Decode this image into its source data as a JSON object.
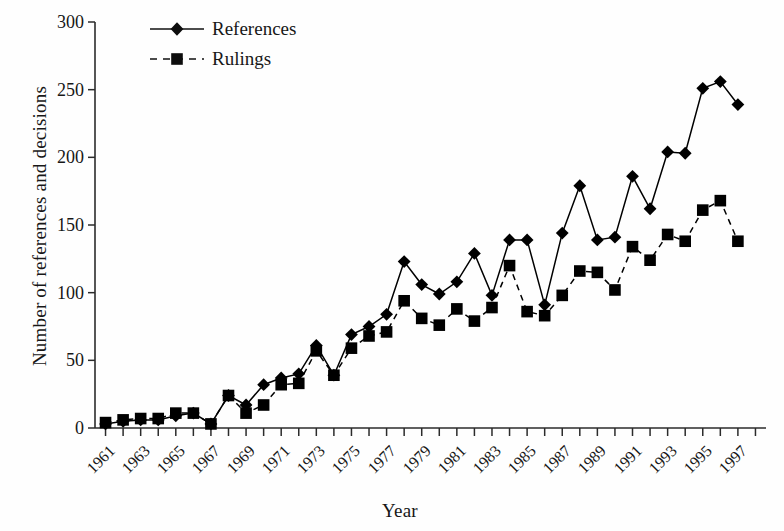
{
  "chart_data": {
    "type": "line",
    "title": "",
    "xlabel": "Year",
    "ylabel": "Number of references and decisions",
    "xlim": [
      1960.4,
      1998.6
    ],
    "ylim": [
      0,
      300
    ],
    "yticks": [
      0,
      50,
      100,
      150,
      200,
      250,
      300
    ],
    "ytick_labels": [
      "0",
      "50",
      "100",
      "150",
      "200",
      "250",
      "300"
    ],
    "xticks": [
      1961,
      1963,
      1965,
      1967,
      1969,
      1971,
      1973,
      1975,
      1977,
      1979,
      1981,
      1983,
      1985,
      1987,
      1989,
      1991,
      1993,
      1995,
      1997
    ],
    "xtick_labels": [
      "1961",
      "1963",
      "1965",
      "1967",
      "1969",
      "1971",
      "1973",
      "1975",
      "1977",
      "1979",
      "1981",
      "1983",
      "1985",
      "1987",
      "1989",
      "1991",
      "1993",
      "1995",
      "1997"
    ],
    "x": [
      1961,
      1962,
      1963,
      1964,
      1965,
      1966,
      1967,
      1968,
      1969,
      1970,
      1971,
      1972,
      1973,
      1974,
      1975,
      1976,
      1977,
      1978,
      1979,
      1980,
      1981,
      1982,
      1983,
      1984,
      1985,
      1986,
      1987,
      1988,
      1989,
      1990,
      1991,
      1992,
      1993,
      1994,
      1995,
      1996,
      1997
    ],
    "grid": false,
    "legend_position": "top-left",
    "series": [
      {
        "name": "References",
        "marker": "diamond",
        "linestyle": "solid",
        "color": "#000000",
        "values": [
          3,
          5,
          6,
          6,
          9,
          11,
          3,
          24,
          17,
          32,
          37,
          40,
          61,
          39,
          69,
          75,
          84,
          123,
          106,
          99,
          108,
          129,
          98,
          139,
          139,
          91,
          144,
          179,
          139,
          141,
          186,
          162,
          204,
          203,
          251,
          256,
          239
        ]
      },
      {
        "name": "Rulings",
        "marker": "square",
        "linestyle": "dashed",
        "color": "#000000",
        "values": [
          4,
          6,
          7,
          7,
          11,
          11,
          3,
          24,
          11,
          17,
          32,
          33,
          57,
          39,
          59,
          68,
          71,
          94,
          81,
          76,
          88,
          79,
          89,
          120,
          86,
          83,
          98,
          116,
          115,
          102,
          134,
          124,
          143,
          138,
          161,
          168,
          138
        ]
      }
    ],
    "legend": [
      "References",
      "Rulings"
    ],
    "colors": {
      "line": "#000000",
      "axis": "#2b2b2b",
      "background": "#ffffff"
    }
  },
  "geometry": {
    "plot_left": 95,
    "plot_right": 766,
    "plot_top": 22,
    "plot_bottom": 428,
    "year_min": 1960.4,
    "year_max": 1998.6
  },
  "legend": {
    "rows": [
      {
        "label": "References",
        "marker": "diamond-icon",
        "style": "solid"
      },
      {
        "label": "Rulings",
        "marker": "square-icon",
        "style": "dashed"
      }
    ]
  },
  "axes": {
    "x_title": "Year",
    "y_title": "Number of references and decisions"
  }
}
